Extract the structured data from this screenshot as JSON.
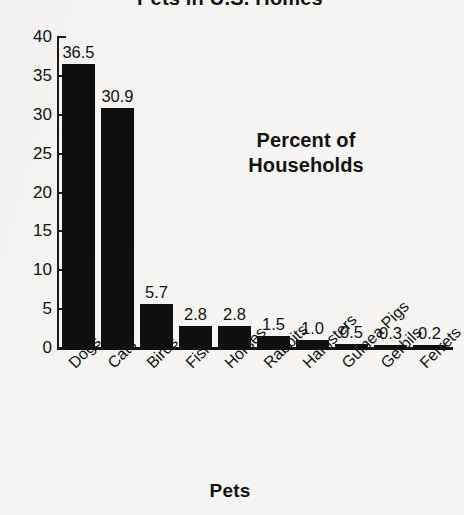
{
  "chart_data": {
    "type": "bar",
    "title": "Pets in U.S. Homes",
    "xlabel": "Pets",
    "ylabel": "Percent of Households",
    "annotation": "Percent of Households",
    "annotation_line1": "Percent of",
    "annotation_line2": "Households",
    "categories": [
      "Dogs",
      "Cats",
      "Birds",
      "Fish",
      "Horses",
      "Rabbits",
      "Hamsters",
      "Guinea Pigs",
      "Gerbils",
      "Ferrets"
    ],
    "values": [
      36.5,
      30.9,
      5.7,
      2.8,
      2.8,
      1.5,
      1.0,
      0.5,
      0.3,
      0.2
    ],
    "value_labels": [
      "36.5",
      "30.9",
      "5.7",
      "2.8",
      "2.8",
      "1.5",
      "1.0",
      "0.5",
      "0.3",
      "0.2"
    ],
    "ylim": [
      0,
      40
    ],
    "yticks": [
      0,
      5,
      10,
      15,
      20,
      25,
      30,
      35,
      40
    ],
    "ytick_labels": [
      "0",
      "5",
      "10",
      "15",
      "20",
      "25",
      "30",
      "35",
      "40"
    ],
    "grid": false,
    "legend": false,
    "bar_color": "#100f0f",
    "background_color": "#f6f5f3",
    "text_color": "#121111",
    "tick_label_rotation": -45
  }
}
